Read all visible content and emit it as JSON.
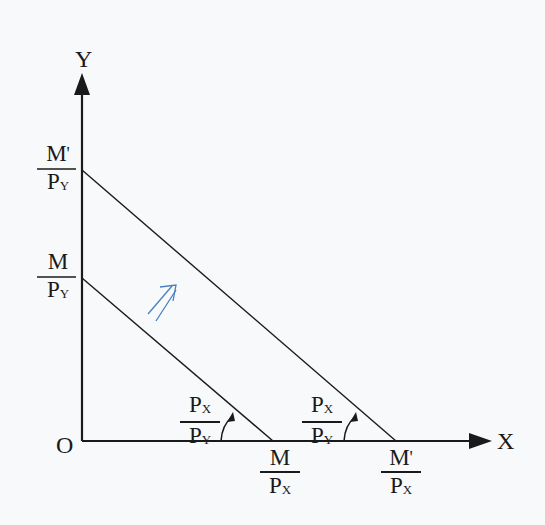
{
  "diagram": {
    "axes": {
      "y_label": "Y",
      "x_label": "X",
      "origin_label": "O"
    },
    "y_intercepts": [
      {
        "id": "original",
        "num": "M",
        "den_main": "P",
        "den_sub": "Y",
        "prime": ""
      },
      {
        "id": "new",
        "num": "M",
        "den_main": "P",
        "den_sub": "Y",
        "prime": "'"
      }
    ],
    "x_intercepts": [
      {
        "id": "original",
        "num": "M",
        "den_main": "P",
        "den_sub": "X",
        "prime": ""
      },
      {
        "id": "new",
        "num": "M",
        "den_main": "P",
        "den_sub": "X",
        "prime": "'"
      }
    ],
    "slope_labels": [
      {
        "id": "original",
        "num_main": "P",
        "num_sub": "X",
        "den_main": "P",
        "den_sub": "Y"
      },
      {
        "id": "new",
        "num_main": "P",
        "num_sub": "X",
        "den_main": "P",
        "den_sub": "Y"
      }
    ],
    "shift_arrow": {
      "direction": "outward (northeast)",
      "color": "#4a7fc1"
    },
    "line_color": "#1a1a1a"
  }
}
